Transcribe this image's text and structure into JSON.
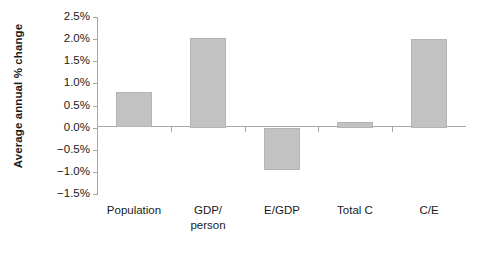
{
  "chart_data": {
    "type": "bar",
    "title": "",
    "subtitle": "",
    "xlabel": "",
    "ylabel": "Average annual % change",
    "categories": [
      "Population",
      "GDP/ person",
      "E/GDP",
      "Total C",
      "C/E"
    ],
    "category_lines": [
      [
        "Population"
      ],
      [
        "GDP/",
        "person"
      ],
      [
        "E/GDP"
      ],
      [
        "Total C"
      ],
      [
        "C/E"
      ]
    ],
    "values": [
      0.8,
      2.03,
      -0.96,
      0.13,
      2.0
    ],
    "value_labels": [
      "0.8%",
      "2.03%",
      "-0.96%",
      "0.13%",
      "2.0%"
    ],
    "ylim": [
      -1.5,
      2.5
    ],
    "ytick_values": [
      2.5,
      2.0,
      1.5,
      1.0,
      0.5,
      0.0,
      -0.5,
      -1.0,
      -1.5
    ],
    "ytick_labels": [
      "2.5%",
      "2.0%",
      "1.5%",
      "1.0%",
      "0.5%",
      "0.0%",
      "−0.5%",
      "−1.0%",
      "−1.5%"
    ],
    "grid": false,
    "legend": null,
    "legend_position": "none",
    "bar_color": "#c2c2c2",
    "bar_border_color": "#b4b4b4",
    "axis_color": "#a6a6a6",
    "text_color": "#1a1a1a",
    "background_color": "#ffffff"
  }
}
